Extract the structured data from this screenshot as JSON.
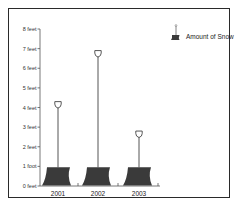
{
  "chart_data": {
    "type": "bar",
    "style": "pictograph",
    "pictogram": "snow-shovel",
    "title": "",
    "xlabel": "",
    "ylabel": "",
    "categories": [
      "2001",
      "2002",
      "2003"
    ],
    "series": [
      {
        "name": "Amount of Snow",
        "values": [
          4.3,
          6.9,
          2.8
        ]
      }
    ],
    "values": [
      4.3,
      6.9,
      2.8
    ],
    "ylim": [
      0,
      8
    ],
    "y_ticks": [
      "0 feet",
      "1 foot",
      "2 feet",
      "3 feet",
      "4 feet",
      "5 feet",
      "6 feet",
      "7 feet",
      "8 feet"
    ],
    "grid": false,
    "legend": {
      "position": "top-right",
      "entries": [
        "Amount of Snow"
      ]
    },
    "colors": {
      "blade": "#3a3a3a",
      "handle": "#555555",
      "axis": "#555555",
      "frame": "#2a2a2a"
    }
  }
}
